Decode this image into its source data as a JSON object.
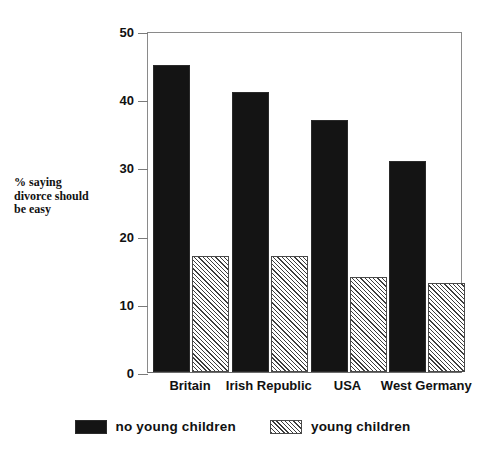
{
  "chart_data": {
    "type": "bar",
    "title": "",
    "subtitle": "",
    "xlabel": "",
    "ylabel": "% saying\ndivorce should\nbe easy",
    "categories": [
      "Britain",
      "Irish Republic",
      "USA",
      "West Germany"
    ],
    "series": [
      {
        "name": "no young children",
        "pattern": "solid-black",
        "color": "#141414",
        "values": [
          45,
          41,
          37,
          31
        ]
      },
      {
        "name": "young children",
        "pattern": "diagonal-hatch",
        "color": "#ffffff",
        "values": [
          17,
          17,
          14,
          13
        ]
      }
    ],
    "ylim": [
      0,
      50
    ],
    "yticks": [
      0,
      10,
      20,
      30,
      40,
      50
    ],
    "ytick_labels": [
      "0",
      "10",
      "20",
      "30",
      "40",
      "50"
    ],
    "grid": false,
    "legend_position": "bottom-center",
    "frame": true
  },
  "legend": {
    "entries": [
      {
        "label": "no young children",
        "swatch": "solid-swatch"
      },
      {
        "label": "young children",
        "swatch": "hatch-swatch"
      }
    ]
  }
}
